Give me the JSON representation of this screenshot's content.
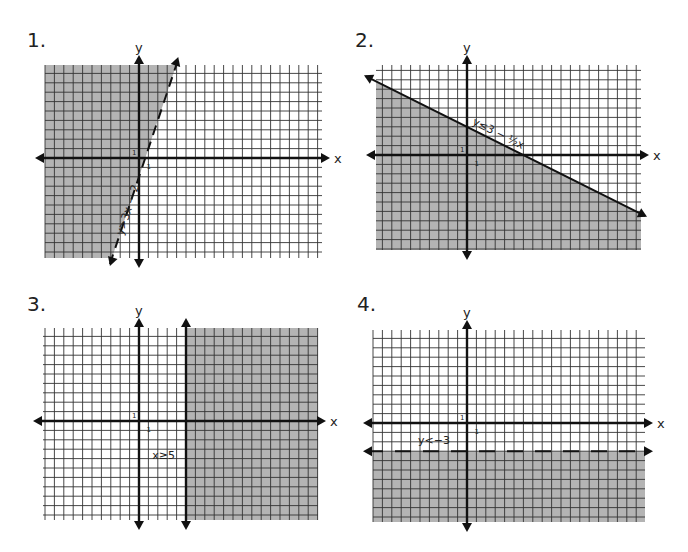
{
  "chart_data": [
    {
      "type": "inequality-graph",
      "number": "1.",
      "inequality": "y>3x − 2",
      "boundary": {
        "kind": "line",
        "slope": 3,
        "intercept": -2,
        "style": "dashed"
      },
      "shade": "left-of-line",
      "xlabel": "x",
      "ylabel": "y",
      "tick_label_x": "1",
      "tick_label_y": "1",
      "xlim": [
        -10,
        19
      ],
      "ylim": [
        -10,
        10
      ],
      "grid": true
    },
    {
      "type": "inequality-graph",
      "number": "2.",
      "inequality": "y≤3 − ½x",
      "boundary": {
        "kind": "line",
        "slope": -0.5,
        "intercept": 3,
        "style": "solid"
      },
      "shade": "below",
      "xlabel": "x",
      "ylabel": "y",
      "tick_label_x": "1",
      "tick_label_y": "1",
      "xlim": [
        -10,
        19
      ],
      "ylim": [
        -10,
        10
      ],
      "grid": true
    },
    {
      "type": "inequality-graph",
      "number": "3.",
      "inequality": "x≥5",
      "boundary": {
        "kind": "vertical",
        "x": 5,
        "style": "solid"
      },
      "shade": "right",
      "xlabel": "x",
      "ylabel": "y",
      "tick_label_x": "1",
      "tick_label_y": "1",
      "xlim": [
        -10,
        19
      ],
      "ylim": [
        -10,
        10
      ],
      "grid": true
    },
    {
      "type": "inequality-graph",
      "number": "4.",
      "inequality": "y<−3",
      "boundary": {
        "kind": "horizontal",
        "y": -3,
        "style": "dashed"
      },
      "shade": "below",
      "xlabel": "x",
      "ylabel": "y",
      "tick_label_x": "1",
      "tick_label_y": "1",
      "xlim": [
        -10,
        19
      ],
      "ylim": [
        -10,
        10
      ],
      "grid": true
    }
  ],
  "colors": {
    "shade": "#b4b4b4",
    "grid": "#333333",
    "axis": "#111111",
    "background": "#ffffff"
  }
}
